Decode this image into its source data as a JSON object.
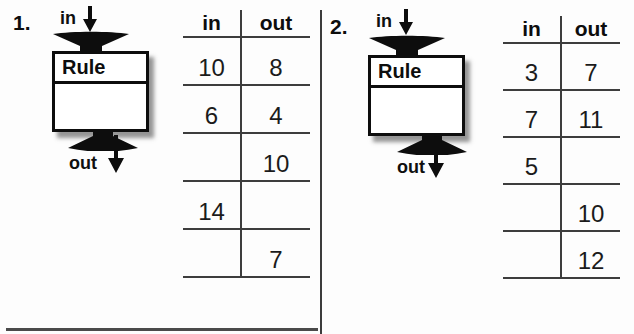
{
  "colors": {
    "ink": "#111111",
    "table_line": "#3d3d3d"
  },
  "problems": [
    {
      "number": "1.",
      "machine": {
        "in_label": "in",
        "rule_label": "Rule",
        "out_label": "out",
        "in_arrow_icon": "down-arrow",
        "out_arrow_icon": "down-arrow"
      },
      "table": {
        "headers": {
          "in": "in",
          "out": "out"
        },
        "rows": [
          {
            "in": "10",
            "out": "8"
          },
          {
            "in": "6",
            "out": "4"
          },
          {
            "in": "",
            "out": "10"
          },
          {
            "in": "14",
            "out": ""
          },
          {
            "in": "",
            "out": "7"
          }
        ]
      }
    },
    {
      "number": "2.",
      "machine": {
        "in_label": "in",
        "rule_label": "Rule",
        "out_label": "out",
        "in_arrow_icon": "down-arrow",
        "out_arrow_icon": "down-arrow"
      },
      "table": {
        "headers": {
          "in": "in",
          "out": "out"
        },
        "rows": [
          {
            "in": "3",
            "out": "7"
          },
          {
            "in": "7",
            "out": "11"
          },
          {
            "in": "5",
            "out": ""
          },
          {
            "in": "",
            "out": "10"
          },
          {
            "in": "",
            "out": "12"
          }
        ]
      }
    }
  ]
}
